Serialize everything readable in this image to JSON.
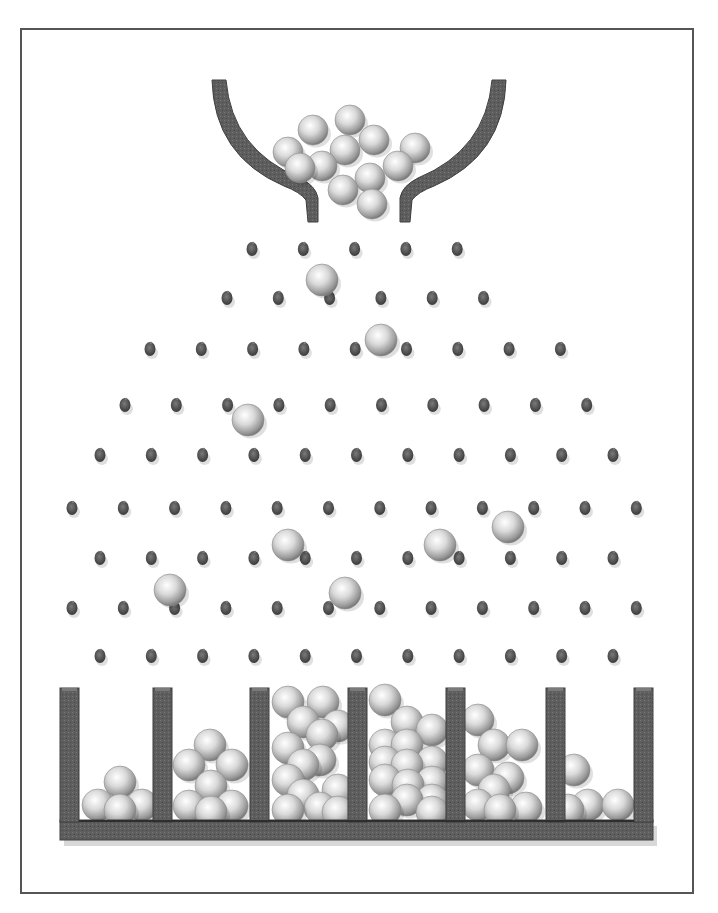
{
  "diagram": {
    "title": "Galton board (bean machine) illustration",
    "colors": {
      "frame": "#555555",
      "wood": "#5f5f5f",
      "wood_dark": "#3e3e3e",
      "peg": "#5a5a5a",
      "ball_light": "#ffffff",
      "ball_mid": "#d4d4d4",
      "ball_dark": "#8c8c8c"
    },
    "frame": {
      "x": 20,
      "y": 28,
      "w": 674,
      "h": 866
    },
    "hopper": {
      "path": "M212 80 L226 80 Q232 150 300 178 Q316 186 318 198 L318 222 L308 222 L306 200 Q300 192 284 186 Q214 156 212 80 Z",
      "path_right": "M506 80 L492 80 Q486 150 418 178 Q402 186 400 198 L400 222 L410 222 L412 200 Q418 192 434 186 Q504 156 506 80 Z"
    },
    "peg_radius": 6,
    "peg_rows": [
      {
        "y": 249,
        "x0": 252,
        "count": 5
      },
      {
        "y": 298,
        "x0": 227,
        "count": 6
      },
      {
        "y": 349,
        "x0": 150,
        "count": 9
      },
      {
        "y": 405,
        "x0": 125,
        "count": 10
      },
      {
        "y": 455,
        "x0": 100,
        "count": 11
      },
      {
        "y": 508,
        "x0": 72,
        "count": 12
      },
      {
        "y": 558,
        "x0": 100,
        "count": 11
      },
      {
        "y": 608,
        "x0": 72,
        "count": 12
      },
      {
        "y": 656,
        "x0": 100,
        "count": 11
      }
    ],
    "peg_spacing": 51.3,
    "ball_radius": 15,
    "hopper_balls": [
      [
        350,
        120
      ],
      [
        313,
        130
      ],
      [
        374,
        140
      ],
      [
        288,
        152
      ],
      [
        345,
        150
      ],
      [
        415,
        148
      ],
      [
        398,
        166
      ],
      [
        322,
        166
      ],
      [
        300,
        168
      ],
      [
        370,
        178
      ],
      [
        343,
        190
      ],
      [
        372,
        204
      ]
    ],
    "falling_balls": [
      [
        322,
        280
      ],
      [
        381,
        340
      ],
      [
        248,
        420
      ],
      [
        508,
        527
      ],
      [
        288,
        545
      ],
      [
        440,
        545
      ],
      [
        170,
        590
      ],
      [
        345,
        593
      ]
    ],
    "bins": {
      "wall_x": [
        60,
        153,
        250,
        348,
        446,
        546,
        634
      ],
      "wall_width": 19,
      "wall_top": 688,
      "floor_top": 820,
      "floor_bottom": 840,
      "left": 60,
      "right": 653,
      "counts": [
        4,
        7,
        14,
        15,
        9,
        4
      ]
    },
    "bin_balls": [
      [
        [
          98,
          805
        ],
        [
          120,
          782
        ],
        [
          142,
          805
        ],
        [
          120,
          810
        ]
      ],
      [
        [
          210,
          745
        ],
        [
          189,
          765
        ],
        [
          232,
          765
        ],
        [
          211,
          786
        ],
        [
          189,
          806
        ],
        [
          232,
          806
        ],
        [
          211,
          812
        ]
      ],
      [
        [
          288,
          702
        ],
        [
          323,
          702
        ],
        [
          303,
          722
        ],
        [
          338,
          726
        ],
        [
          288,
          748
        ],
        [
          320,
          760
        ],
        [
          338,
          790
        ],
        [
          288,
          780
        ],
        [
          303,
          795
        ],
        [
          320,
          808
        ],
        [
          288,
          810
        ],
        [
          338,
          812
        ],
        [
          303,
          765
        ],
        [
          322,
          735
        ]
      ],
      [
        [
          385,
          700
        ],
        [
          407,
          722
        ],
        [
          385,
          745
        ],
        [
          432,
          730
        ],
        [
          407,
          765
        ],
        [
          432,
          762
        ],
        [
          385,
          780
        ],
        [
          432,
          800
        ],
        [
          407,
          800
        ],
        [
          385,
          810
        ],
        [
          432,
          812
        ],
        [
          407,
          745
        ],
        [
          385,
          762
        ],
        [
          432,
          782
        ],
        [
          408,
          785
        ]
      ],
      [
        [
          478,
          720
        ],
        [
          494,
          745
        ],
        [
          522,
          745
        ],
        [
          478,
          770
        ],
        [
          508,
          778
        ],
        [
          478,
          805
        ],
        [
          500,
          810
        ],
        [
          526,
          808
        ],
        [
          494,
          790
        ]
      ],
      [
        [
          574,
          770
        ],
        [
          588,
          805
        ],
        [
          618,
          805
        ],
        [
          568,
          810
        ]
      ]
    ]
  }
}
